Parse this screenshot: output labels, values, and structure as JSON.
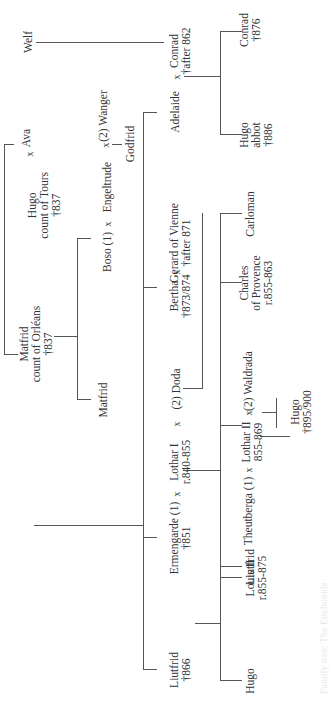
{
  "diagram": {
    "type": "genealogy-tree",
    "orientation": "rotated-90-ccw",
    "line_color": "#555555",
    "text_color": "#333333",
    "people": {
      "welf": {
        "name": "Welf"
      },
      "conrad": {
        "name": "Conrad",
        "detail": "†after 862"
      },
      "adelaide": {
        "name": "Adelaide"
      },
      "conrad_jr": {
        "name": "Conrad",
        "detail": "†876"
      },
      "hugo_abbot": {
        "name": "Hugo",
        "detail": "abbot",
        "detail2": "†886"
      },
      "matfrid_orleans": {
        "name": "Matfrid",
        "detail": "count of Orléans",
        "detail2": "†837"
      },
      "wanger": {
        "name": "(2) Wanger"
      },
      "engeltrude": {
        "name": "Engeltrude"
      },
      "boso": {
        "name": "Boso (1)"
      },
      "godfrid": {
        "name": "Godfrid"
      },
      "matfrid": {
        "name": "Matfrid"
      },
      "gerard": {
        "name": "Gerard of Vienne",
        "detail": "†after 871"
      },
      "bertha": {
        "name": "Bertha",
        "detail": "†873/874"
      },
      "carloman": {
        "name": "Carloman"
      },
      "charles": {
        "name": "Charles",
        "detail": "of Provence",
        "detail2": "r.855-863"
      },
      "waldrada": {
        "name": "(2) Waldrada"
      },
      "lothar2": {
        "name": "Lothar II",
        "detail": "855-869"
      },
      "theutberga": {
        "name": "Theutberga (1)"
      },
      "hugo_895": {
        "name": "Hugo",
        "detail": "†895/900"
      },
      "doda": {
        "name": "(2) Doda"
      },
      "lothar1": {
        "name": "Lothar I",
        "detail": "r.840-855"
      },
      "ermengarde": {
        "name": "Ermengarde (1)",
        "detail": "†851"
      },
      "louis2": {
        "name": "Louis II",
        "detail": "r.855-875"
      },
      "ava": {
        "name": "Ava"
      },
      "hugo_tours": {
        "name": "Hugo",
        "detail": "count of Tours",
        "detail2": "†837"
      },
      "liutfrid": {
        "name": "Liutfrid",
        "detail": "†866"
      },
      "liutfrid_jr": {
        "name": "Liutfrid"
      },
      "hugo_jr": {
        "name": "Hugo"
      }
    },
    "marriage_symbol": "x",
    "caption": "Family tree: The Etichonids"
  }
}
